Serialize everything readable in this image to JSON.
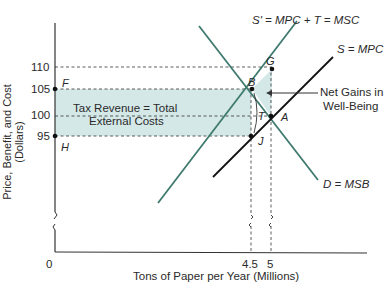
{
  "axes": {
    "y_label": "Price, Benefit, and Cost (Dollars)",
    "x_label": "Tons of Paper per Year (Millions)",
    "y_ticks": [
      "110",
      "105",
      "100",
      "95"
    ],
    "x_ticks": [
      "0",
      "4.5",
      "5"
    ]
  },
  "curves": {
    "s_prime": "S' = MPC + T = MSC",
    "s": "S = MPC",
    "d": "D = MSB"
  },
  "points": {
    "F": "F",
    "H": "H",
    "G": "G",
    "B": "B",
    "A": "A",
    "J": "J",
    "T": "T"
  },
  "annotations": {
    "tax_revenue_line1": "Tax Revenue = Total",
    "tax_revenue_line2": "External Costs",
    "net_gains_line1": "Net Gains in",
    "net_gains_line2": "Well-Being"
  },
  "colors": {
    "shade": "#d4e8e8",
    "s_prime_line": "#3f7a6e",
    "d_line": "#3f7a6e",
    "s_line": "#111111"
  }
}
